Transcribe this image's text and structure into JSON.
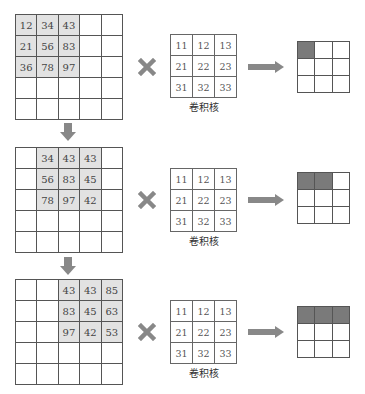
{
  "diagram": {
    "kernel_label": "卷积核",
    "colors": {
      "highlight": "#e2e2e2",
      "output_filled": "#7a7a7a",
      "icon_gray": "#888888",
      "line": "#555555"
    },
    "steps": [
      {
        "input": {
          "rows": [
            [
              "12",
              "34",
              "43",
              "",
              ""
            ],
            [
              "21",
              "56",
              "83",
              "",
              ""
            ],
            [
              "36",
              "78",
              "97",
              "",
              ""
            ],
            [
              "",
              "",
              "",
              "",
              ""
            ],
            [
              "",
              "",
              "",
              "",
              ""
            ]
          ],
          "highlight": {
            "row_start": 0,
            "col_start": 0,
            "size": 3
          }
        },
        "kernel": [
          [
            "11",
            "12",
            "13"
          ],
          [
            "21",
            "22",
            "23"
          ],
          [
            "31",
            "32",
            "33"
          ]
        ],
        "output_filled_count": 1
      },
      {
        "input": {
          "rows": [
            [
              "",
              "34",
              "43",
              "43",
              ""
            ],
            [
              "",
              "56",
              "83",
              "45",
              ""
            ],
            [
              "",
              "78",
              "97",
              "42",
              ""
            ],
            [
              "",
              "",
              "",
              "",
              ""
            ],
            [
              "",
              "",
              "",
              "",
              ""
            ]
          ],
          "highlight": {
            "row_start": 0,
            "col_start": 1,
            "size": 3
          }
        },
        "kernel": [
          [
            "11",
            "12",
            "13"
          ],
          [
            "21",
            "22",
            "23"
          ],
          [
            "31",
            "32",
            "33"
          ]
        ],
        "output_filled_count": 2
      },
      {
        "input": {
          "rows": [
            [
              "",
              "",
              "43",
              "43",
              "85"
            ],
            [
              "",
              "",
              "83",
              "45",
              "63"
            ],
            [
              "",
              "",
              "97",
              "42",
              "53"
            ],
            [
              "",
              "",
              "",
              "",
              ""
            ],
            [
              "",
              "",
              "",
              "",
              ""
            ]
          ],
          "highlight": {
            "row_start": 0,
            "col_start": 2,
            "size": 3
          }
        },
        "kernel": [
          [
            "11",
            "12",
            "13"
          ],
          [
            "21",
            "22",
            "23"
          ],
          [
            "31",
            "32",
            "33"
          ]
        ],
        "output_filled_count": 3
      }
    ],
    "icons": {
      "operator": "multiply-icon",
      "result_arrow": "right-arrow-icon",
      "step_arrow": "down-arrow-icon"
    }
  }
}
